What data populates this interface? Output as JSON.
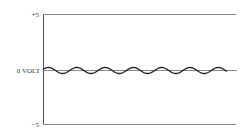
{
  "chart_data": {
    "type": "line",
    "title": "",
    "xlabel": "",
    "ylabel": "",
    "ylim": [
      -5,
      5
    ],
    "yticks": [
      {
        "label": "+5",
        "value": 5
      },
      {
        "label": "0 VOLT",
        "value": 0
      },
      {
        "label": "−5",
        "value": -5
      }
    ],
    "grid": false,
    "series": [
      {
        "name": "ripple",
        "description": "small-amplitude sinusoidal oscillation centered on 0 volts",
        "amplitude": 0.3,
        "cycles": 6.5,
        "color": "#222222"
      }
    ],
    "reference_lines": [
      {
        "value": 5,
        "color": "#777777"
      },
      {
        "value": 0,
        "color": "#777777"
      },
      {
        "value": -5,
        "color": "#777777"
      }
    ]
  },
  "labels": {
    "top": "+5",
    "zero": "0 VOLT",
    "bottom": "−5"
  }
}
